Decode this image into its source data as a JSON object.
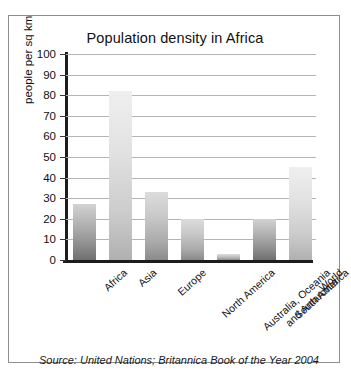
{
  "panel": {
    "source_note": "Source: United Nations; Britannica Book of the Year 2004"
  },
  "chart_data": {
    "type": "bar",
    "title": "Population density in Africa",
    "xlabel": "",
    "ylabel": "people per sq km",
    "ylim": [
      0,
      100
    ],
    "ytick_step": 10,
    "yticks": [
      "100",
      "90",
      "80",
      "70",
      "60",
      "50",
      "40",
      "30",
      "20",
      "10",
      "0"
    ],
    "grid": true,
    "legend": "none",
    "categories": [
      "Africa",
      "Asia",
      "Europe",
      "North America",
      "Australia, Oceania\nand Antarctica",
      "South America",
      "World"
    ],
    "category_labels": [
      {
        "line1": "Africa",
        "line2": ""
      },
      {
        "line1": "Asia",
        "line2": ""
      },
      {
        "line1": "Europe",
        "line2": ""
      },
      {
        "line1": "North America",
        "line2": ""
      },
      {
        "line1": "Australia, Oceania",
        "line2": "and Antarctica"
      },
      {
        "line1": "South America",
        "line2": ""
      },
      {
        "line1": "World",
        "line2": ""
      }
    ],
    "values": [
      27,
      82,
      33,
      20,
      3,
      20,
      45
    ],
    "bar_styles": [
      "dark",
      "light",
      "mid",
      "mid",
      "mid",
      "dark",
      "light"
    ],
    "colors": {
      "bar_dark_top": "#d2d2d2",
      "bar_dark_bottom": "#6f6f6f",
      "bar_light_top": "#efefef",
      "bar_light_bottom": "#b0b0b0",
      "axis": "#1c1c1c",
      "gridline": "#b4b4b4",
      "panel_border": "#8d8d8d",
      "text": "#111111",
      "background": "#ffffff"
    }
  }
}
